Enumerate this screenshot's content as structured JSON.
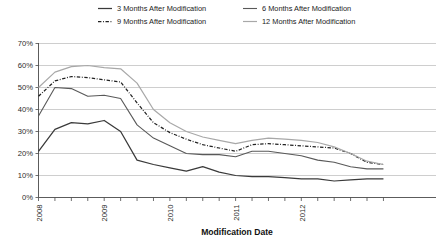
{
  "chart_data": {
    "type": "line",
    "title": "",
    "xlabel": "Modification Date",
    "ylabel": "",
    "ylim": [
      0,
      70
    ],
    "ytick_labels": [
      "0%",
      "10%",
      "20%",
      "30%",
      "40%",
      "50%",
      "60%",
      "70%"
    ],
    "ytick_values": [
      0,
      10,
      20,
      30,
      40,
      50,
      60,
      70
    ],
    "grid": true,
    "legend_position": "top",
    "xtick_labels": [
      "2008",
      "2009",
      "2010",
      "2011",
      "2012"
    ],
    "xtick_label_positions": [
      0,
      4,
      8,
      12,
      16
    ],
    "x_minor_ticks": 22,
    "x": [
      0,
      1,
      2,
      3,
      4,
      5,
      6,
      7,
      8,
      9,
      10,
      11,
      12,
      13,
      14,
      15,
      16,
      17,
      18,
      19,
      20,
      21
    ],
    "series": [
      {
        "name": "3 Months After Modification",
        "style": "solid",
        "color": "#3a3a3a",
        "width": 1.25,
        "values": [
          21,
          31,
          34,
          33.5,
          35,
          30,
          17,
          15,
          13.5,
          12,
          14,
          11.5,
          10,
          9.5,
          9.5,
          9,
          8.5,
          8.5,
          7.5,
          8,
          8.5,
          8.5
        ]
      },
      {
        "name": "6 Months After Modification",
        "style": "solid",
        "color": "#595959",
        "width": 1.1,
        "values": [
          37,
          50,
          49.5,
          46,
          46.5,
          45,
          33,
          27,
          23.5,
          20,
          19.5,
          19.5,
          18.5,
          21,
          21,
          20,
          19,
          17,
          16,
          14,
          13,
          13
        ]
      },
      {
        "name": "9 Months After Modification",
        "style": "dashdot",
        "color": "#222222",
        "width": 1.25,
        "values": [
          46,
          53,
          55,
          54.5,
          53.5,
          52.5,
          43,
          34,
          29.5,
          26.5,
          24,
          22.5,
          21,
          24,
          24.5,
          24,
          23.5,
          23,
          22.5,
          20,
          16,
          15
        ]
      },
      {
        "name": "12 Months After Modification",
        "style": "solid",
        "color": "#a8a8a8",
        "width": 1.2,
        "values": [
          50,
          57,
          59.5,
          60,
          59,
          58.5,
          52,
          40,
          34,
          30,
          27.5,
          26,
          24.5,
          26,
          27,
          26.5,
          26,
          25,
          23,
          20,
          16.5,
          15
        ]
      }
    ]
  },
  "legend": {
    "entries": [
      {
        "label": "3 Months After Modification"
      },
      {
        "label": "6 Months After Modification"
      },
      {
        "label": "9 Months After Modification"
      },
      {
        "label": "12 Months After Modification"
      }
    ]
  },
  "axis": {
    "x_title": "Modification Date"
  }
}
